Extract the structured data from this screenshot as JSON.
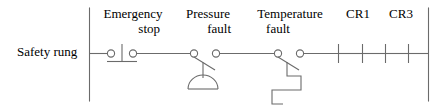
{
  "diagram": {
    "kind": "ladder-logic-rung",
    "rung_label": "Safety rung",
    "line_color": "#6b6b6b",
    "text_color": "#000000",
    "background": "#ffffff",
    "devices": [
      {
        "id": "emergency-stop",
        "label_line1": "Emergency",
        "label_line2": "stop",
        "symbol": "mushroom-head-pushbutton-nc",
        "state": "normally-closed"
      },
      {
        "id": "pressure-fault",
        "label_line1": "Pressure",
        "label_line2": "fault",
        "symbol": "pressure-switch-nc-diaphragm",
        "state": "normally-closed"
      },
      {
        "id": "temperature-fault",
        "label_line1": "Temperature",
        "label_line2": "fault",
        "symbol": "temperature-switch-nc-bimetallic",
        "state": "normally-closed"
      },
      {
        "id": "cr1",
        "label_line1": "CR1",
        "label_line2": "",
        "symbol": "relay-contact-no",
        "state": "normally-open"
      },
      {
        "id": "cr3",
        "label_line1": "CR3",
        "label_line2": "",
        "symbol": "relay-contact-no",
        "state": "normally-open"
      }
    ]
  }
}
